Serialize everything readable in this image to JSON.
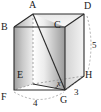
{
  "figure": {
    "shape_name": "rectangular-prism",
    "stroke_color": "#2b2b2b",
    "dashed_color": "#8a8a8a",
    "face_light": "#f2f2f2",
    "face_mid": "#d9d9d9",
    "face_dark": "#a8a8a8",
    "label_color": "#1a1a1a"
  },
  "vertices": [
    {
      "id": "A",
      "label": "A",
      "x": 33,
      "y": 10
    },
    {
      "id": "B",
      "label": "B",
      "x": 4,
      "y": 28
    },
    {
      "id": "C",
      "label": "C",
      "x": 57,
      "y": 27
    },
    {
      "id": "D",
      "label": "D",
      "x": 86,
      "y": 10
    },
    {
      "id": "E",
      "label": "E",
      "x": 18,
      "y": 72
    },
    {
      "id": "F",
      "label": "F",
      "x": 2,
      "y": 96
    },
    {
      "id": "G",
      "label": "G",
      "x": 62,
      "y": 97
    },
    {
      "id": "H",
      "label": "H",
      "x": 85,
      "y": 73
    }
  ],
  "measurements": [
    {
      "id": "FG",
      "label": "4",
      "x": 34,
      "y": 99,
      "edge": "F-G",
      "unit": ""
    },
    {
      "id": "GH",
      "label": "3",
      "x": 75,
      "y": 90,
      "edge": "G-H",
      "unit": ""
    },
    {
      "id": "DH",
      "label": "5",
      "x": 91,
      "y": 45,
      "edge": "D-H",
      "unit": ""
    }
  ],
  "angles": [
    {
      "id": "angle-x",
      "label": "x",
      "x": 60,
      "y": 84,
      "at_vertex": "G",
      "between": "GA and GE"
    }
  ],
  "diagonals": [
    {
      "id": "AG",
      "from": "A",
      "to": "G",
      "style": "solid"
    },
    {
      "id": "EG",
      "from": "E",
      "to": "G",
      "style": "solid"
    },
    {
      "id": "AE",
      "from": "A",
      "to": "E",
      "style": "dashed"
    },
    {
      "id": "EH",
      "from": "E",
      "to": "H",
      "style": "dashed"
    },
    {
      "id": "EF",
      "from": "E",
      "to": "F",
      "style": "dashed"
    }
  ]
}
